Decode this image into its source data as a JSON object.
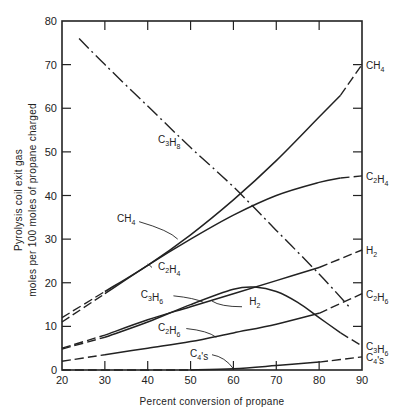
{
  "chart_data": {
    "type": "line",
    "title": "",
    "xlabel": "Percent conversion of propane",
    "ylabel": [
      "Pyrolysis coil exit gas",
      "moles per 100 moles of propane charged"
    ],
    "xlim": [
      20,
      90
    ],
    "ylim": [
      0,
      80
    ],
    "xticks": [
      20,
      30,
      40,
      50,
      60,
      70,
      80,
      90
    ],
    "yticks": [
      0,
      10,
      20,
      30,
      40,
      50,
      60,
      70,
      80
    ],
    "grid": false,
    "legend_position": "inline labels (right edge and annotations)",
    "series": [
      {
        "name": "CH4",
        "style": "solid, dashed at extremes",
        "x": [
          20,
          30,
          40,
          50,
          60,
          70,
          80,
          85,
          90
        ],
        "y": [
          12,
          18,
          24,
          31,
          39,
          48,
          58,
          63,
          70
        ]
      },
      {
        "name": "C2H4",
        "style": "solid, dashed at extremes",
        "x": [
          20,
          30,
          40,
          50,
          60,
          70,
          80,
          85,
          90
        ],
        "y": [
          11,
          17.5,
          24,
          30,
          35.5,
          40,
          43,
          44,
          44.5
        ]
      },
      {
        "name": "C3H8",
        "style": "dash-dot",
        "x": [
          24,
          30,
          40,
          50,
          60,
          70,
          80,
          87
        ],
        "y": [
          76,
          70,
          60.5,
          51,
          42,
          32,
          22,
          14.5
        ]
      },
      {
        "name": "H2",
        "style": "solid, dashed at extremes",
        "x": [
          20,
          30,
          40,
          50,
          60,
          70,
          80,
          90
        ],
        "y": [
          5,
          8,
          11.5,
          14.5,
          17.5,
          20.5,
          23.5,
          27.5
        ]
      },
      {
        "name": "C3H6",
        "style": "solid, dashed at extremes",
        "x": [
          20,
          30,
          40,
          50,
          60,
          65,
          70,
          75,
          80,
          85,
          90
        ],
        "y": [
          4.8,
          7.5,
          11,
          15,
          18.5,
          19,
          18,
          15.5,
          12,
          8.5,
          5.5
        ]
      },
      {
        "name": "C2H6",
        "style": "solid, dashed at extremes",
        "x": [
          20,
          30,
          40,
          50,
          60,
          70,
          80,
          90
        ],
        "y": [
          2,
          3.5,
          5,
          6.5,
          8.5,
          10.5,
          13,
          17.5
        ]
      },
      {
        "name": "C4's",
        "style": "solid, dashed at extremes",
        "x": [
          20,
          50,
          60,
          70,
          80,
          90
        ],
        "y": [
          0,
          0,
          0.3,
          1,
          1.8,
          3
        ]
      }
    ],
    "annotations": [
      {
        "text": "C3H8",
        "x": 45,
        "y": 52
      },
      {
        "text": "CH4",
        "x": 35,
        "y": 34
      },
      {
        "text": "C2H4",
        "x": 45,
        "y": 23
      },
      {
        "text": "C3H6",
        "x": 41,
        "y": 16.5
      },
      {
        "text": "H2",
        "x": 65,
        "y": 15
      },
      {
        "text": "C2H6",
        "x": 45,
        "y": 9
      },
      {
        "text": "C4's",
        "x": 52,
        "y": 3
      }
    ]
  },
  "labels": {
    "xlabel": "Percent conversion of propane",
    "ylabel_line1": "Pyrolysis coil exit gas",
    "ylabel_line2": "moles per 100 moles of propane charged"
  }
}
